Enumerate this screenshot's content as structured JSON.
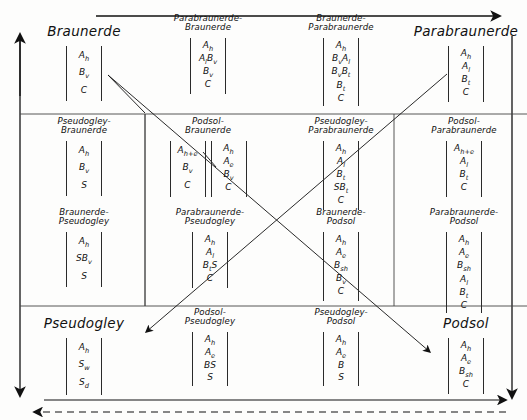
{
  "diagram": {
    "title_semantics": "soil-type-transition-matrix",
    "axis_arrows": [
      {
        "name": "left-vertical-arrow",
        "direction": "down"
      },
      {
        "name": "top-horizontal-arrow",
        "direction": "right"
      },
      {
        "name": "right-vertical-arrow",
        "direction": "down"
      },
      {
        "name": "bottom-horizontal-arrow",
        "direction": "right"
      },
      {
        "name": "bottom-dashed-arrow",
        "direction": "left"
      }
    ]
  },
  "cells": [
    {
      "id": "braunerde",
      "kind": "major",
      "title": "Braunerde",
      "profiles": [
        {
          "spacing": "wide",
          "horizons": [
            "A|h",
            "B|v",
            "C"
          ]
        }
      ]
    },
    {
      "id": "parabraunerde-braunerde",
      "kind": "minor",
      "title": "Parabraunerde-\nBraunerde",
      "profiles": [
        {
          "spacing": "normal",
          "horizons": [
            "A|h",
            "A|l|B|v",
            "B|v",
            "C"
          ]
        }
      ]
    },
    {
      "id": "braunerde-parabraunerde",
      "kind": "minor",
      "title": "Braunerde-\nParabraunerde",
      "profiles": [
        {
          "spacing": "tight",
          "horizons": [
            "A|h",
            "B|v|A|l",
            "B|v|B|t",
            "B|t",
            "C"
          ]
        }
      ]
    },
    {
      "id": "parabraunerde",
      "kind": "major",
      "title": "Parabraunerde",
      "profiles": [
        {
          "spacing": "normal",
          "horizons": [
            "A|h",
            "A|l",
            "B|t",
            "C"
          ]
        }
      ]
    },
    {
      "id": "pseudogley-braunerde",
      "kind": "minor",
      "title": "Pseudogley-\nBraunerde",
      "profiles": [
        {
          "spacing": "wide",
          "horizons": [
            "A|h",
            "B|v",
            "S"
          ]
        }
      ]
    },
    {
      "id": "podsol-braunerde",
      "kind": "minor",
      "title": "Podsol-\nBraunerde",
      "profiles": [
        {
          "spacing": "wide",
          "horizons": [
            "A|h+e",
            "B|v",
            "C"
          ]
        },
        {
          "spacing": "normal",
          "horizons": [
            "A|h",
            "A|e",
            "B|v",
            "C"
          ]
        }
      ]
    },
    {
      "id": "pseudogley-parabraunerde",
      "kind": "minor",
      "title": "Pseudogley-\nParabraunerde",
      "profiles": [
        {
          "spacing": "normal",
          "horizons": [
            "A|h",
            "A|l",
            "B|t",
            "SB|t",
            "C"
          ]
        }
      ]
    },
    {
      "id": "podsol-parabraunerde",
      "kind": "minor",
      "title": "Podsol-\nParabraunerde",
      "profiles": [
        {
          "spacing": "normal",
          "horizons": [
            "A|h+e",
            "A|l",
            "B|t",
            "C"
          ]
        }
      ]
    },
    {
      "id": "braunerde-pseudogley",
      "kind": "minor",
      "title": "Braunerde-\nPseudogley",
      "profiles": [
        {
          "spacing": "wide",
          "horizons": [
            "A|h",
            "SB|v",
            "S"
          ]
        }
      ]
    },
    {
      "id": "parabraunerde-pseudogley",
      "kind": "minor",
      "title": "Parabraunerde-\nPseudogley",
      "profiles": [
        {
          "spacing": "normal",
          "horizons": [
            "A|h",
            "A|l",
            "B|t|S",
            "C"
          ]
        }
      ]
    },
    {
      "id": "braunerde-podsol",
      "kind": "minor",
      "title": "Braunerde-\nPodsol",
      "profiles": [
        {
          "spacing": "normal",
          "horizons": [
            "A|h",
            "A|e",
            "B|sh",
            "B|v",
            "C"
          ]
        }
      ]
    },
    {
      "id": "parabraunerde-podsol",
      "kind": "minor",
      "title": "Parabraunerde-\nPodsol",
      "profiles": [
        {
          "spacing": "tight",
          "horizons": [
            "A|h",
            "A|e",
            "B|sh",
            "A|l",
            "B|t",
            "C"
          ]
        }
      ]
    },
    {
      "id": "pseudogley",
      "kind": "major",
      "title": "Pseudogley",
      "profiles": [
        {
          "spacing": "wide",
          "horizons": [
            "A|h",
            "S|w",
            "S|d"
          ]
        }
      ]
    },
    {
      "id": "podsol-pseudogley",
      "kind": "minor",
      "title": "Podsol-\nPseudogley",
      "profiles": [
        {
          "spacing": "normal",
          "horizons": [
            "A|h",
            "A|e",
            "BS",
            "S"
          ]
        }
      ]
    },
    {
      "id": "pseudogley-podsol",
      "kind": "minor",
      "title": "Pseudogley-\nPodsol",
      "profiles": [
        {
          "spacing": "normal",
          "horizons": [
            "A|h",
            "A|e",
            "B",
            "S"
          ]
        }
      ]
    },
    {
      "id": "podsol",
      "kind": "major",
      "title": "Podsol",
      "profiles": [
        {
          "spacing": "normal",
          "horizons": [
            "A|h",
            "A|e",
            "B|sh",
            "C"
          ]
        }
      ]
    }
  ],
  "layout": {
    "positions": {
      "braunerde": {
        "x": 24,
        "y": 24,
        "w": 120,
        "titleTop": 0,
        "profTop": 22
      },
      "parabraunerde-braunerde": {
        "x": 152,
        "y": 14,
        "w": 112,
        "titleTop": 0,
        "profTop": 24
      },
      "braunerde-parabraunerde": {
        "x": 282,
        "y": 14,
        "w": 118,
        "titleTop": 0,
        "profTop": 24
      },
      "parabraunerde": {
        "x": 408,
        "y": 24,
        "w": 116,
        "titleTop": 0,
        "profTop": 22
      },
      "pseudogley-braunerde": {
        "x": 24,
        "y": 117,
        "w": 120,
        "titleTop": 0,
        "profTop": 24
      },
      "podsol-braunerde": {
        "x": 152,
        "y": 117,
        "w": 112,
        "titleTop": 0,
        "profTop": 24
      },
      "pseudogley-parabraunerde": {
        "x": 282,
        "y": 117,
        "w": 118,
        "titleTop": 0,
        "profTop": 24
      },
      "podsol-parabraunerde": {
        "x": 404,
        "y": 117,
        "w": 120,
        "titleTop": 0,
        "profTop": 24
      },
      "braunerde-pseudogley": {
        "x": 24,
        "y": 208,
        "w": 120,
        "titleTop": 0,
        "profTop": 24
      },
      "parabraunerde-pseudogley": {
        "x": 150,
        "y": 208,
        "w": 120,
        "titleTop": 0,
        "profTop": 24
      },
      "braunerde-podsol": {
        "x": 282,
        "y": 208,
        "w": 118,
        "titleTop": 0,
        "profTop": 24
      },
      "parabraunerde-podsol": {
        "x": 404,
        "y": 208,
        "w": 120,
        "titleTop": 0,
        "profTop": 24
      },
      "pseudogley": {
        "x": 24,
        "y": 316,
        "w": 120,
        "titleTop": 0,
        "profTop": 22
      },
      "podsol-pseudogley": {
        "x": 152,
        "y": 308,
        "w": 116,
        "titleTop": 0,
        "profTop": 24
      },
      "pseudogley-podsol": {
        "x": 282,
        "y": 308,
        "w": 118,
        "titleTop": 0,
        "profTop": 24
      },
      "podsol": {
        "x": 408,
        "y": 316,
        "w": 116,
        "titleTop": 0,
        "profTop": 22
      }
    }
  }
}
